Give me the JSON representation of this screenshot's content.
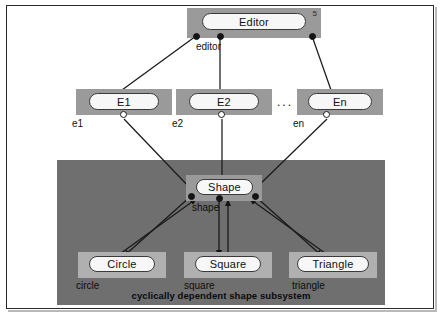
{
  "figure": {
    "caption": "cyclically dependent shape subsystem"
  },
  "nodes": {
    "editor": {
      "label": "Editor",
      "badge": "5",
      "instance": "editor"
    },
    "e1": {
      "label": "E1",
      "instance": "e1"
    },
    "e2": {
      "label": "E2",
      "instance": "e2"
    },
    "en": {
      "label": "En",
      "instance": "en"
    },
    "ellipsis": "...",
    "shape": {
      "label": "Shape",
      "instance": "shape"
    },
    "circle": {
      "label": "Circle",
      "instance": "circle"
    },
    "square": {
      "label": "Square",
      "instance": "square"
    },
    "triangle": {
      "label": "Triangle",
      "instance": "triangle"
    }
  },
  "colors": {
    "page_background": "#ffffff",
    "frame_border": "#2b2b2b",
    "subsystem_fill": "#6f6f6f",
    "plate_fill": "#9a9a9a",
    "plate_fill_light": "#b0b0b0",
    "capsule_fill": "#f7f7f7",
    "line": "#1a1a1a",
    "port_filled": "#141414",
    "port_hollow": "#ffffff"
  }
}
